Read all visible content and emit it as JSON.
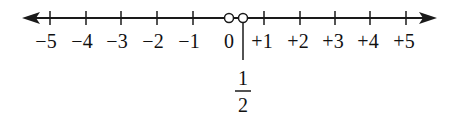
{
  "diagram": {
    "type": "number_line",
    "range": [
      -5,
      5
    ],
    "ticks": [
      {
        "value": -5,
        "label": "−5"
      },
      {
        "value": -4,
        "label": "−4"
      },
      {
        "value": -3,
        "label": "−3"
      },
      {
        "value": -2,
        "label": "−2"
      },
      {
        "value": -1,
        "label": "−1"
      },
      {
        "value": 0,
        "label": "0"
      },
      {
        "value": 1,
        "label": "+1"
      },
      {
        "value": 2,
        "label": "+2"
      },
      {
        "value": 3,
        "label": "+3"
      },
      {
        "value": 4,
        "label": "+4"
      },
      {
        "value": 5,
        "label": "+5"
      }
    ],
    "open_points": [
      {
        "value": 0,
        "label": "0"
      },
      {
        "value": 0.5,
        "label": "1/2"
      }
    ],
    "callout": {
      "value": 0.5,
      "numerator": "1",
      "denominator": "2"
    },
    "arrows": [
      "left",
      "right"
    ],
    "colors": {
      "line": "#1a1a1a",
      "text": "#111111",
      "background": "#ffffff"
    }
  }
}
